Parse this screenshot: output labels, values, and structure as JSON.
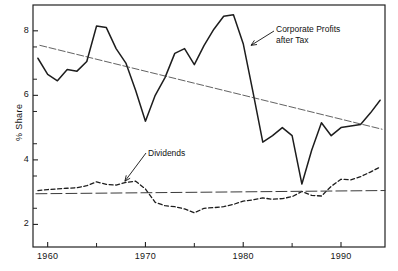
{
  "chart_data": {
    "type": "line",
    "title": "",
    "xlabel": "",
    "ylabel": "% Share",
    "xlim": [
      1958.5,
      1994.5
    ],
    "ylim": [
      1.3,
      8.8
    ],
    "xticks": [
      1960,
      1970,
      1980,
      1990
    ],
    "xtick_labels": [
      "1960",
      "1970",
      "1980",
      "1990"
    ],
    "xminorticks": [
      1965,
      1975,
      1985
    ],
    "yticks": [
      2,
      4,
      6,
      8
    ],
    "ytick_labels": [
      "2",
      "4",
      "6",
      "8"
    ],
    "yminorticks": [
      2.5,
      3.5,
      4.5,
      5.5,
      6.5,
      7.5
    ],
    "grid": false,
    "legend": "annotations",
    "series": [
      {
        "name": "Corporate Profits after Tax",
        "style": "solid",
        "x": [
          1959,
          1960,
          1961,
          1962,
          1963,
          1964,
          1965,
          1966,
          1967,
          1968,
          1969,
          1970,
          1971,
          1972,
          1973,
          1974,
          1975,
          1976,
          1977,
          1978,
          1979,
          1980,
          1981,
          1982,
          1983,
          1984,
          1985,
          1986,
          1987,
          1988,
          1989,
          1990,
          1991,
          1992,
          1993,
          1994
        ],
        "y": [
          7.15,
          6.65,
          6.45,
          6.8,
          6.75,
          7.05,
          8.15,
          8.1,
          7.45,
          7.0,
          6.15,
          5.2,
          6.0,
          6.55,
          7.3,
          7.45,
          6.95,
          7.55,
          8.05,
          8.45,
          8.5,
          7.6,
          6.1,
          4.55,
          4.75,
          5.0,
          4.75,
          3.25,
          4.3,
          5.15,
          4.75,
          5.0,
          5.05,
          5.1,
          5.45,
          5.85
        ]
      },
      {
        "name": "Dividends",
        "style": "dashed",
        "x": [
          1959,
          1960,
          1961,
          1962,
          1963,
          1964,
          1965,
          1966,
          1967,
          1968,
          1969,
          1970,
          1971,
          1972,
          1973,
          1974,
          1975,
          1976,
          1977,
          1978,
          1979,
          1980,
          1981,
          1982,
          1983,
          1984,
          1985,
          1986,
          1987,
          1988,
          1989,
          1990,
          1991,
          1992,
          1993,
          1994
        ],
        "y": [
          3.05,
          3.08,
          3.1,
          3.12,
          3.14,
          3.2,
          3.32,
          3.24,
          3.22,
          3.3,
          3.34,
          3.1,
          2.68,
          2.58,
          2.55,
          2.48,
          2.36,
          2.5,
          2.52,
          2.55,
          2.62,
          2.72,
          2.76,
          2.82,
          2.78,
          2.8,
          2.86,
          3.02,
          2.9,
          2.88,
          3.18,
          3.4,
          3.38,
          3.48,
          3.62,
          3.78
        ]
      },
      {
        "name": "Corporate Profits trend",
        "style": "trend-thin",
        "x": [
          1959.2,
          1994.2
        ],
        "y": [
          7.55,
          4.95
        ]
      },
      {
        "name": "Dividends mean",
        "style": "trend-longdash",
        "x": [
          1958.8,
          1994.5
        ],
        "y": [
          2.95,
          3.05
        ]
      }
    ],
    "annotations": [
      {
        "name": "corporate-profits-annotation",
        "text_line1": "Corporate Profits",
        "text_line2": "after Tax",
        "points_to_x": 1980.8,
        "points_to_y": 7.55
      },
      {
        "name": "dividends-annotation",
        "text_line1": "Dividends",
        "text_line2": "",
        "points_to_x": 1967.9,
        "points_to_y": 3.34
      }
    ]
  },
  "figure": {
    "caption": ""
  }
}
